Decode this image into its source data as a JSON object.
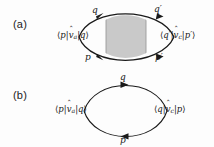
{
  "figure": {
    "width": 214,
    "height": 147,
    "background_color": "#fdfdfd",
    "line_color": "#1a1a1a",
    "shade_color": "#c9c9c9",
    "text_color": "#171717"
  },
  "panels": [
    {
      "id": "a",
      "label": "(a)",
      "type": "loop-with-shaded-blob",
      "shaded_box": {
        "present": true,
        "fill": "#c9c9c9",
        "stroke": "#8e8e8e",
        "description": "vertical shaded rectangle spanning the loop interior"
      },
      "left_matrix_element": {
        "bra": "p",
        "operator": "v",
        "operator_hat": "ˆ",
        "operator_subscript": "a",
        "ket": "q",
        "plain": "⟨p|v̂a|q⟩"
      },
      "right_matrix_element": {
        "bra": "q′",
        "operator": "v",
        "operator_hat": "ˆ",
        "operator_subscript": "c",
        "ket": "p′",
        "plain": "⟨q′|v̂c|p′⟩"
      },
      "propagator_labels": {
        "top_left": "q",
        "top_right": "q′",
        "bottom_left": "p",
        "bottom_right": "p′"
      }
    },
    {
      "id": "b",
      "label": "(b)",
      "type": "simple-loop",
      "shaded_box": {
        "present": false
      },
      "left_matrix_element": {
        "bra": "p",
        "operator": "v",
        "operator_hat": "ˆ",
        "operator_subscript": "a",
        "ket": "q",
        "plain": "⟨p|v̂a|q⟩"
      },
      "right_matrix_element": {
        "bra": "q",
        "operator": "v",
        "operator_hat": "ˆ",
        "operator_subscript": "c",
        "ket": "p",
        "plain": "⟨q|v̂c|p⟩"
      },
      "propagator_labels": {
        "top": "q",
        "bottom": "p"
      }
    }
  ]
}
